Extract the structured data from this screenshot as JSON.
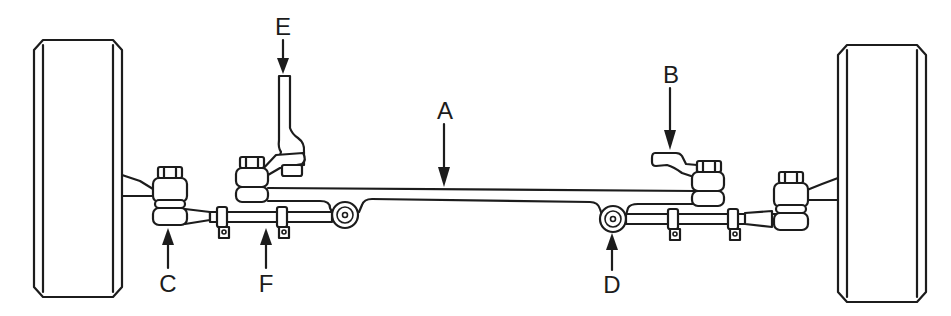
{
  "diagram": {
    "title": "",
    "colors": {
      "line": "#1c1c1c",
      "background": "#ffffff"
    },
    "callouts": [
      {
        "id": "A",
        "label": "A",
        "points_to": "center-link",
        "x": 445,
        "y": 99,
        "arrow": "down"
      },
      {
        "id": "B",
        "label": "B",
        "points_to": "idler-arm",
        "x": 671,
        "y": 63,
        "arrow": "down"
      },
      {
        "id": "C",
        "label": "C",
        "points_to": "outer-tie-rod-end-left",
        "x": 168,
        "y": 272,
        "arrow": "up"
      },
      {
        "id": "D",
        "label": "D",
        "points_to": "inner-tie-rod-end-right",
        "x": 612,
        "y": 273,
        "arrow": "up"
      },
      {
        "id": "E",
        "label": "E",
        "points_to": "pitman-arm",
        "x": 283,
        "y": 15,
        "arrow": "down"
      },
      {
        "id": "F",
        "label": "F",
        "points_to": "adjusting-sleeve-left",
        "x": 266,
        "y": 272,
        "arrow": "up"
      }
    ],
    "parts": [
      "left-wheel",
      "right-wheel",
      "center-link",
      "pitman-arm",
      "idler-arm",
      "tie-rods",
      "adjusting-sleeves",
      "tie-rod-ends"
    ]
  }
}
